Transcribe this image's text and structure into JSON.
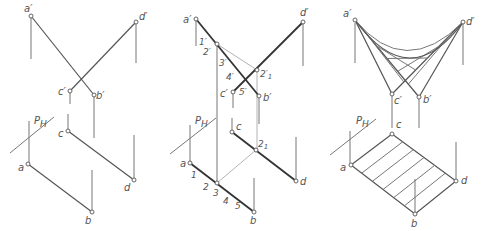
{
  "figure": {
    "panels": [
      {
        "id": "left",
        "description": "Two skew lines AB and CD projected; horizontal plane trace P_H",
        "labels": {
          "a_prime": "a′",
          "d_prime": "d′",
          "c_prime": "c′",
          "b_prime": "b′",
          "ph": "P",
          "ph_sub": "H",
          "c": "c",
          "a": "a",
          "d": "d",
          "b": "b"
        }
      },
      {
        "id": "middle",
        "description": "Construction of intermediate points 1–5 along ab with auxiliary projections",
        "labels": {
          "a_prime": "a′",
          "d_prime": "d′",
          "one_prime": "1′",
          "two_prime": "2′",
          "three_prime": "3′",
          "four_prime": "4′",
          "two1_prime": "2′",
          "two1_prime_sub": "1",
          "c_prime": "c′",
          "five_prime": "5′",
          "b_prime": "b′",
          "ph": "P",
          "ph_sub": "H",
          "c": "c",
          "two1": "2",
          "two1_sub": "1",
          "a": "a",
          "one": "1",
          "two": "2",
          "three": "3",
          "four": "4",
          "five": "5",
          "d": "d",
          "b": "b"
        }
      },
      {
        "id": "right",
        "description": "Resulting hyperbolic paraboloid: ruled lines in front view, parallel rulings in plan",
        "labels": {
          "a_prime": "a′",
          "d_prime": "d′",
          "c_prime": "c′",
          "b_prime": "b′",
          "ph": "P",
          "ph_sub": "H",
          "c": "c",
          "a": "a",
          "d": "d",
          "b": "b"
        }
      }
    ]
  }
}
